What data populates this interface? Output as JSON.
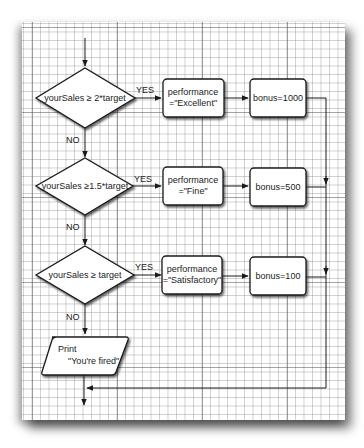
{
  "diagram": {
    "type": "flowchart",
    "decisions": [
      {
        "label": "yourSales ≥ 2*target",
        "yes": "YES",
        "no": "NO"
      },
      {
        "label": "yourSales ≥1.5*target",
        "yes": "YES",
        "no": "NO"
      },
      {
        "label": "yourSales ≥ target",
        "yes": "YES",
        "no": "NO"
      }
    ],
    "performance_boxes": [
      {
        "line1": "performance",
        "line2": "=\"Excellent\""
      },
      {
        "line1": "performance",
        "line2": "=\"Fine\""
      },
      {
        "line1": "performance",
        "line2": "=\"Satisfactory\""
      }
    ],
    "bonus_boxes": [
      {
        "label": "bonus=1000"
      },
      {
        "label": "bonus=500"
      },
      {
        "label": "bonus=100"
      }
    ],
    "output_box": {
      "line1": "Print",
      "line2": "\"You're fired\""
    }
  },
  "colors": {
    "paper": "#ffffff",
    "grid_minor": "#969696",
    "grid_major": "#5a5a5a",
    "stroke": "#1a1a1a",
    "text": "#222222"
  }
}
